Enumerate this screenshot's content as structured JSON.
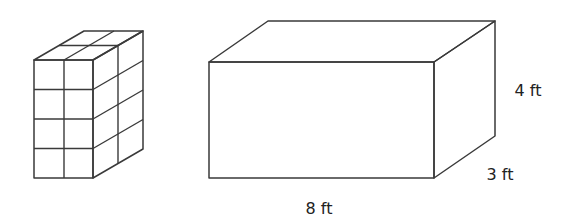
{
  "figure": {
    "unit_cube_prism": {
      "cubes_wide": 2,
      "cubes_tall": 4,
      "cubes_deep": 2
    },
    "large_box": {
      "labels": {
        "length": "8 ft",
        "width": "3 ft",
        "height": "4 ft"
      }
    }
  }
}
